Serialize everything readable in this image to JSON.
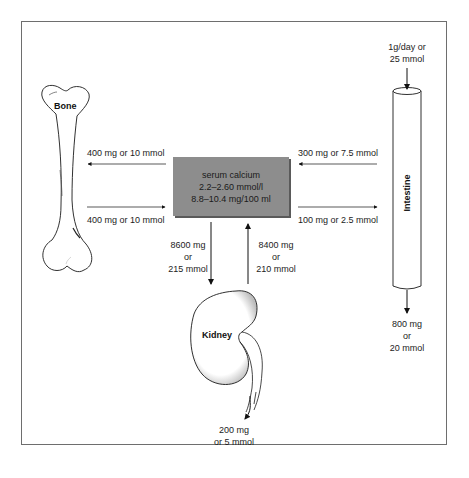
{
  "diagram": {
    "central_node": {
      "line1": "serum calcium",
      "line2": "2.2–2.60 mmol/l",
      "line3": "8.8–10.4 mg/100 ml",
      "fill_color": "#8d8d8d"
    },
    "organs": {
      "bone": "Bone",
      "intestine": "Intestine",
      "kidney": "Kidney"
    },
    "flows": {
      "serum_to_bone": "400 mg or 10 mmol",
      "bone_to_serum": "400 mg or 10 mmol",
      "intestine_to_serum": "300 mg or 7.5 mmol",
      "serum_to_intestine": "100 mg or 2.5 mmol",
      "intake": {
        "line1": "1g/day or",
        "line2": "25 mmol"
      },
      "fecal_loss": {
        "line1": "800 mg",
        "line2": "or",
        "line3": "20 mmol"
      },
      "serum_to_kidney": {
        "line1": "8600 mg",
        "line2": "or",
        "line3": "215 mmol"
      },
      "kidney_to_serum": {
        "line1": "8400 mg",
        "line2": "or",
        "line3": "210 mmol"
      },
      "urinary_loss": {
        "line1": "200 mg",
        "line2": "or 5 mmol"
      }
    }
  }
}
